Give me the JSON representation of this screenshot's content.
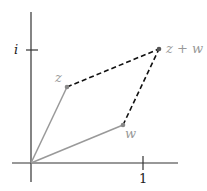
{
  "diagram": {
    "title": "",
    "type": "complex-plane-vector-addition",
    "colors": {
      "axis": "#333333",
      "vector": "#999999",
      "dashed": "#111111",
      "point": "#888888",
      "label": "#999999",
      "tick_label": "#222222"
    },
    "axes": {
      "origin_px": [
        31,
        163
      ],
      "real_unit_px": 112,
      "imag_unit_px": 113,
      "x_tick_label": "1",
      "y_tick_label": "i"
    },
    "points": [
      {
        "name": "z",
        "label": "z",
        "re": 0.32,
        "im": 0.67
      },
      {
        "name": "w",
        "label": "w",
        "re": 0.82,
        "im": 0.34
      },
      {
        "name": "z+w",
        "label": "z + w",
        "re": 1.14,
        "im": 1.01
      }
    ],
    "edges": [
      {
        "from": "origin",
        "to": "z",
        "style": "solid"
      },
      {
        "from": "origin",
        "to": "w",
        "style": "solid"
      },
      {
        "from": "z",
        "to": "z+w",
        "style": "dashed"
      },
      {
        "from": "w",
        "to": "z+w",
        "style": "dashed"
      }
    ]
  }
}
